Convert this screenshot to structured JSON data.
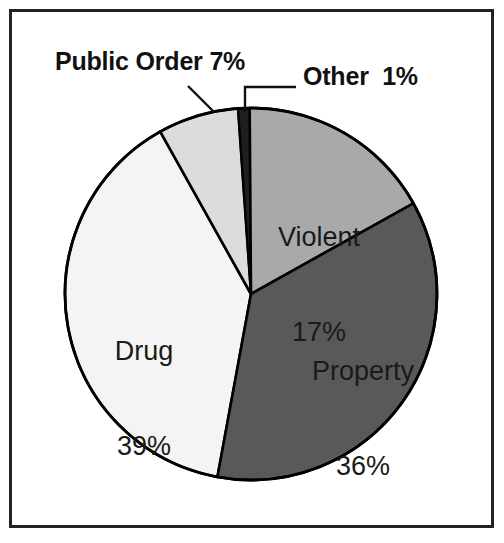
{
  "chart_data": {
    "type": "pie",
    "title": "",
    "subtitle": "",
    "xlabel": "",
    "ylabel": "",
    "legend_position": "none",
    "grid": false,
    "units": "percent",
    "total": 100,
    "start_angle_deg": -4,
    "direction": "clockwise",
    "categories": [
      "Other",
      "Violent",
      "Property",
      "Drug",
      "Public Order"
    ],
    "values": [
      1,
      17,
      36,
      39,
      7
    ],
    "slices": [
      {
        "name": "Other",
        "label": "Other",
        "value": 1,
        "value_text": "1%",
        "full_text": "Other  1%",
        "color": "#1f1f1f",
        "label_placement": "callout",
        "leader": "elbow"
      },
      {
        "name": "Violent",
        "label": "Violent",
        "value": 17,
        "value_text": "17%",
        "color": "#a9a9a9",
        "label_placement": "inside",
        "leader": "none"
      },
      {
        "name": "Property",
        "label": "Property",
        "value": 36,
        "value_text": "36%",
        "color": "#595959",
        "label_placement": "inside",
        "leader": "none"
      },
      {
        "name": "Drug",
        "label": "Drug",
        "value": 39,
        "value_text": "39%",
        "color": "#f4f4f4",
        "label_placement": "inside",
        "leader": "none"
      },
      {
        "name": "Public Order",
        "label": "Public Order",
        "value": 7,
        "value_text": "7%",
        "full_text": "Public Order 7%",
        "color": "#dcdcdc",
        "label_placement": "callout",
        "leader": "diagonal"
      }
    ]
  },
  "figure": {
    "frame_color": "#222222",
    "background_color": "#ffffff",
    "outline_color": "#000000"
  },
  "labels": {
    "public_order": "Public Order 7%",
    "other": "Other  1%",
    "violent_name": "Violent",
    "violent_value": "17%",
    "property_name": "Property",
    "property_value": "36%",
    "drug_name": "Drug",
    "drug_value": "39%"
  }
}
